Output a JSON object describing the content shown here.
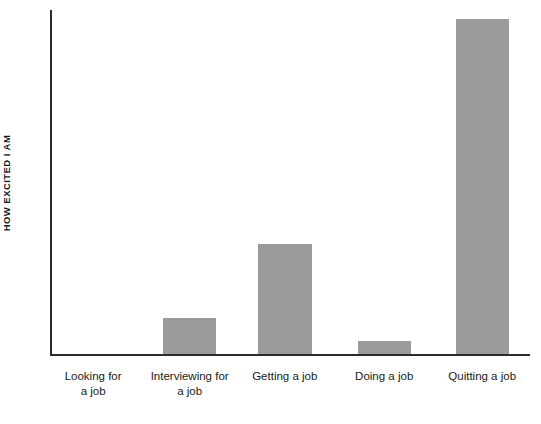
{
  "chart_data": {
    "type": "bar",
    "title": "",
    "subtitle": "",
    "xlabel": "",
    "ylabel": "HOW EXCITED I AM",
    "categories": [
      "Looking for\na job",
      "Interviewing for\na job",
      "Getting a job",
      "Doing a job",
      "Quitting a job"
    ],
    "values": [
      0,
      10.5,
      32,
      3.8,
      97.5
    ],
    "ylim": [
      0,
      100
    ],
    "grid": false,
    "legend": false,
    "legend_position": "none",
    "axis_ticks": {
      "y_tick_labels": [],
      "x_tick_labels": [
        "Looking for a job",
        "Interviewing for a job",
        "Getting a job",
        "Doing a job",
        "Quitting a job"
      ]
    },
    "annotations": [],
    "series": [
      {
        "name": "How excited I am",
        "values": [
          0,
          10.5,
          32,
          3.8,
          97.5
        ]
      }
    ],
    "colors": {
      "bar": "#9b9b9b",
      "axis": "#2b2b2b",
      "background": "#ffffff",
      "text": "#1a1a1a"
    }
  },
  "bars": [
    {
      "label": "Looking for\na job",
      "value": 0,
      "left_pct": 3.0,
      "width_pct": 11.1,
      "height_pct": 0.0
    },
    {
      "label": "Interviewing for\na job",
      "value": 10.5,
      "left_pct": 23.2,
      "width_pct": 11.1,
      "height_pct": 10.5
    },
    {
      "label": "Getting a job",
      "value": 32,
      "left_pct": 43.1,
      "width_pct": 11.3,
      "height_pct": 32.0
    },
    {
      "label": "Doing a job",
      "value": 3.8,
      "left_pct": 64.0,
      "width_pct": 11.1,
      "height_pct": 3.8
    },
    {
      "label": "Quitting a job",
      "value": 97.5,
      "left_pct": 84.5,
      "width_pct": 11.1,
      "height_pct": 97.5
    }
  ],
  "x_labels": [
    {
      "text": "Looking for\na job",
      "center_pct": 8.6
    },
    {
      "text": "Interviewing for\na job",
      "center_pct": 28.8
    },
    {
      "text": "Getting a job",
      "center_pct": 48.7
    },
    {
      "text": "Doing a job",
      "center_pct": 69.5
    },
    {
      "text": "Quitting a job",
      "center_pct": 90.0
    }
  ]
}
